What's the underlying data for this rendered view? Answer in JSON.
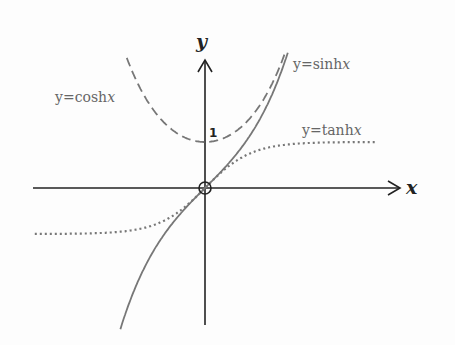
{
  "chart_data": {
    "type": "line",
    "title": "",
    "xlabel": "x",
    "ylabel": "y",
    "grid": false,
    "ticks": {
      "y": [
        "1"
      ]
    },
    "origin_marker": "circle",
    "series": [
      {
        "name": "y=cosh x",
        "style": "dashed",
        "fn": "cosh",
        "x_range": [
          -1.7,
          2.0
        ]
      },
      {
        "name": "y=sinh x",
        "style": "solid",
        "fn": "sinh",
        "x_range": [
          -2.0,
          2.0
        ]
      },
      {
        "name": "y=tanh x",
        "style": "dotted",
        "fn": "tanh",
        "x_range": [
          -3.7,
          3.7
        ]
      }
    ],
    "labels": {
      "cosh": {
        "prefix": "y=cosh",
        "var": "x"
      },
      "sinh": {
        "prefix": "y=sinh",
        "var": "x"
      },
      "tanh": {
        "prefix": "y=tanh",
        "var": "x"
      }
    },
    "colors": {
      "axes": "#222222",
      "curves": "#777777"
    }
  }
}
